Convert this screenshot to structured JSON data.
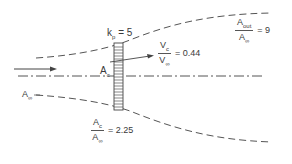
{
  "diagram": {
    "colors": {
      "line": "#555555",
      "text": "#3a3a3a",
      "background": "#ffffff"
    },
    "labels": {
      "kp": {
        "symbol": "k",
        "sub": "p",
        "eq": "= 5"
      },
      "ac": {
        "symbol": "A",
        "sub": "c"
      },
      "a_inf": {
        "symbol": "A",
        "sub": "∞"
      }
    },
    "ratios": {
      "vc_vinf": {
        "num_symbol": "V",
        "num_sub": "c",
        "den_symbol": "V",
        "den_sub": "∞",
        "eq": "= 0.44"
      },
      "aout_ainf": {
        "num_symbol": "A",
        "num_sub": "out",
        "den_symbol": "A",
        "den_sub": "∞",
        "eq": "= 9"
      },
      "ac_ainf": {
        "num_symbol": "A",
        "num_sub": "c",
        "den_symbol": "A",
        "den_sub": "∞",
        "eq": "= 2.25"
      }
    },
    "elements": [
      "flow-arrow",
      "centerline",
      "streamtube-upper",
      "streamtube-lower",
      "actuator-disk",
      "pointer-line"
    ]
  }
}
